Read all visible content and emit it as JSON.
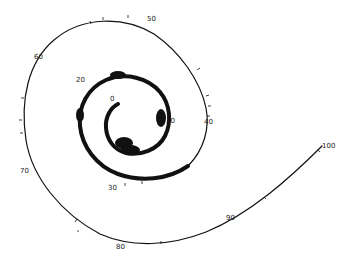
{
  "diagram": {
    "type": "spiral",
    "colors": {
      "line": "#111111",
      "background": "#ffffff"
    },
    "labels": [
      {
        "text": "0",
        "x": 110,
        "y": 101
      },
      {
        "text": "10",
        "x": 166,
        "y": 123
      },
      {
        "text": "20",
        "x": 76,
        "y": 82
      },
      {
        "text": "30",
        "x": 108,
        "y": 190
      },
      {
        "text": "40",
        "x": 204,
        "y": 124
      },
      {
        "text": "50",
        "x": 147,
        "y": 21
      },
      {
        "text": "60",
        "x": 34,
        "y": 59
      },
      {
        "text": "70",
        "x": 20,
        "y": 173
      },
      {
        "text": "80",
        "x": 116,
        "y": 249
      },
      {
        "text": "90",
        "x": 226,
        "y": 220
      },
      {
        "text": "100",
        "x": 322,
        "y": 148
      }
    ]
  }
}
